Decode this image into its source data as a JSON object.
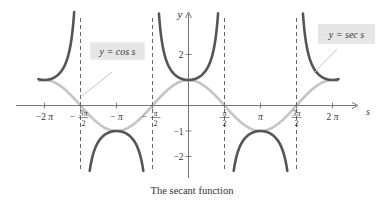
{
  "chart_data": {
    "type": "line",
    "title": "The secant function",
    "xlabel": "s",
    "ylabel": "y",
    "x_ticks": [
      "−2π",
      "−3π/2",
      "−π",
      "−π/2",
      "π/2",
      "π",
      "3π/2",
      "2π"
    ],
    "x_tick_values": [
      -6.2832,
      -4.7124,
      -3.1416,
      -1.5708,
      1.5708,
      3.1416,
      4.7124,
      6.2832
    ],
    "y_ticks": [
      "2",
      "−1",
      "−2"
    ],
    "y_tick_values": [
      2,
      -1,
      -2
    ],
    "xlim": [
      -6.9,
      7.4
    ],
    "ylim": [
      -2.6,
      3.3
    ],
    "asymptotes": [
      -4.7124,
      -1.5708,
      1.5708,
      4.7124
    ],
    "grid": false,
    "series": [
      {
        "name": "y = sec s",
        "color": "#555555",
        "function": "sec",
        "style": "solid-dark",
        "sample_points": [
          [
            -6.2832,
            1
          ],
          [
            -3.1416,
            -1
          ],
          [
            0,
            1
          ],
          [
            3.1416,
            -1
          ],
          [
            6.2832,
            1
          ]
        ]
      },
      {
        "name": "y = cos s",
        "color": "#c4c4c4",
        "function": "cos",
        "style": "solid-light",
        "sample_points": [
          [
            -6.2832,
            1
          ],
          [
            -4.7124,
            0
          ],
          [
            -3.1416,
            -1
          ],
          [
            -1.5708,
            0
          ],
          [
            0,
            1
          ],
          [
            1.5708,
            0
          ],
          [
            3.1416,
            -1
          ],
          [
            4.7124,
            0
          ],
          [
            6.2832,
            1
          ]
        ]
      }
    ],
    "annotations": [
      {
        "text": "y = cos s",
        "points_to": "cos curve near s = −3π/2"
      },
      {
        "text": "y = sec s",
        "points_to": "sec curve near s = 2π"
      }
    ]
  },
  "labels": {
    "axis_x": "s",
    "axis_y": "y",
    "ticks_x": [
      {
        "num": "−2",
        "sym": "π",
        "frac": false
      },
      {
        "num": "3π",
        "den": "2",
        "neg": true,
        "frac": true
      },
      {
        "num": "−",
        "sym": "π",
        "frac": false
      },
      {
        "num": "π",
        "den": "2",
        "neg": true,
        "frac": true
      },
      {
        "num": "π",
        "den": "2",
        "neg": false,
        "frac": true
      },
      {
        "num": "",
        "sym": "π",
        "frac": false
      },
      {
        "num": "3π",
        "den": "2",
        "neg": false,
        "frac": true
      },
      {
        "num": "2",
        "sym": "π",
        "frac": false
      }
    ],
    "ticks_y": [
      "2",
      "−1",
      "−2"
    ],
    "cos_callout": "y = cos s",
    "sec_callout": "y = sec s",
    "caption": "The secant function"
  },
  "colors": {
    "sec": "#555555",
    "cos": "#c4c4c4",
    "axis": "#666666",
    "asymptote": "#555555",
    "callout_bg": "#e6e6e6",
    "leader": "#c4c4c4"
  }
}
